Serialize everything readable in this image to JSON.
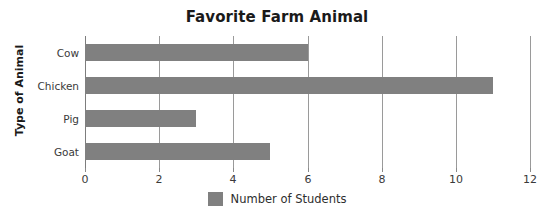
{
  "chart_data": {
    "type": "bar",
    "orientation": "horizontal",
    "title": "Favorite Farm Animal",
    "xlabel": "",
    "ylabel": "Type of Animal",
    "categories": [
      "Cow",
      "Chicken",
      "Pig",
      "Goat"
    ],
    "values": [
      6,
      11,
      3,
      5
    ],
    "series": [
      {
        "name": "Number of Students",
        "values": [
          6,
          11,
          3,
          5
        ]
      }
    ],
    "xlim": [
      0,
      12
    ],
    "xticks": [
      0,
      2,
      4,
      6,
      8,
      10,
      12
    ],
    "xtick_labels": [
      "0",
      "2",
      "4",
      "6",
      "8",
      "10",
      "12"
    ],
    "grid": true,
    "grid_axis": "x",
    "legend": {
      "position": "bottom-center",
      "entries": [
        {
          "label": "Number of Students",
          "color": "#808080"
        }
      ]
    },
    "colors": {
      "bar": "#808080",
      "gridline": "#9a9a9a",
      "axis": "#7d7d7d",
      "title_text": "#1a1a1a",
      "tick_text": "#3a3a3a",
      "background": "#ffffff"
    }
  }
}
